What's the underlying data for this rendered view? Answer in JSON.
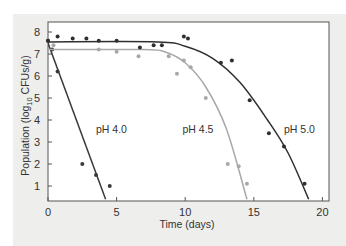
{
  "chart_data": {
    "type": "scatter",
    "title": "",
    "xlabel": "Time (days)",
    "ylabel": "Population (log10 CFUs/g)",
    "ylabel_parts": {
      "pre": "Population (log",
      "sub": "10",
      "post": " CFUs/g)"
    },
    "xlim": [
      0,
      20.5
    ],
    "ylim": [
      0.4,
      8.4
    ],
    "xticks": [
      0,
      5,
      10,
      15,
      20
    ],
    "yticks": [
      1,
      2,
      3,
      4,
      5,
      6,
      7,
      8
    ],
    "grid": false,
    "legend": "inline labels",
    "series": [
      {
        "name": "pH 4.0",
        "label": "pH 4.0",
        "color": "#3a3a3a",
        "points": [
          [
            0,
            7.6
          ],
          [
            0.3,
            7.2
          ],
          [
            0.7,
            6.2
          ],
          [
            2.5,
            2.0
          ],
          [
            3.5,
            1.5
          ],
          [
            4.5,
            1.0
          ]
        ],
        "fit_line": [
          [
            0,
            7.5
          ],
          [
            4.2,
            0.4
          ]
        ]
      },
      {
        "name": "pH 4.5",
        "label": "pH 4.5",
        "color": "#a8a8a8",
        "points": [
          [
            0.4,
            7.4
          ],
          [
            3.7,
            7.2
          ],
          [
            5.0,
            7.1
          ],
          [
            6.6,
            6.9
          ],
          [
            8.8,
            6.9
          ],
          [
            9.4,
            6.1
          ],
          [
            9.9,
            6.7
          ],
          [
            10.4,
            6.4
          ],
          [
            11.5,
            5.0
          ],
          [
            13.1,
            2.0
          ],
          [
            13.9,
            1.9
          ],
          [
            14.5,
            1.1
          ]
        ],
        "fit_curve": [
          [
            0,
            7.2
          ],
          [
            7,
            7.2
          ],
          [
            8.5,
            7.1
          ],
          [
            10,
            6.6
          ],
          [
            11.5,
            5.5
          ],
          [
            13,
            3.6
          ],
          [
            14.5,
            0.4
          ]
        ]
      },
      {
        "name": "pH 5.0",
        "label": "pH 5.0",
        "color": "#2f2f2f",
        "points": [
          [
            0,
            7.6
          ],
          [
            0.7,
            7.8
          ],
          [
            1.8,
            7.7
          ],
          [
            2.8,
            7.7
          ],
          [
            3.7,
            7.6
          ],
          [
            5.0,
            7.6
          ],
          [
            6.7,
            7.3
          ],
          [
            7.7,
            7.4
          ],
          [
            8.3,
            7.4
          ],
          [
            9.9,
            7.8
          ],
          [
            10.2,
            7.7
          ],
          [
            12.6,
            6.6
          ],
          [
            13.4,
            6.7
          ],
          [
            14.7,
            4.9
          ],
          [
            16.1,
            3.4
          ],
          [
            17.2,
            2.8
          ],
          [
            18.7,
            1.1
          ]
        ],
        "fit_curve": [
          [
            0,
            7.55
          ],
          [
            8,
            7.55
          ],
          [
            10,
            7.35
          ],
          [
            12,
            6.8
          ],
          [
            14,
            5.7
          ],
          [
            16,
            4.0
          ],
          [
            17.5,
            2.5
          ],
          [
            19,
            0.4
          ]
        ]
      }
    ]
  }
}
